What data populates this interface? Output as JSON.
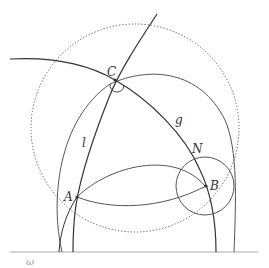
{
  "diagram": {
    "type": "geometry-construction",
    "colors": {
      "stroke_dark": "#333333",
      "stroke_mid": "#555555",
      "baseline": "#aaaaaa",
      "dotted": "#555555",
      "omega_label": "#999999"
    },
    "points": [
      {
        "name": "C",
        "label": "C",
        "x": 115,
        "y": 80,
        "label_x": 107,
        "label_y": 76
      },
      {
        "name": "A",
        "label": "A",
        "x": 77,
        "y": 197,
        "label_x": 64,
        "label_y": 201
      },
      {
        "name": "B",
        "label": "B",
        "x": 206,
        "y": 186,
        "label_x": 210,
        "label_y": 190
      },
      {
        "name": "N",
        "label": "N",
        "x": 194,
        "y": 158,
        "label_x": 192,
        "label_y": 153
      }
    ],
    "line_labels": [
      {
        "name": "l",
        "label": "l",
        "x": 82,
        "y": 147
      },
      {
        "name": "g",
        "label": "g",
        "x": 175,
        "y": 124
      }
    ],
    "baseline": {
      "label": "ω",
      "label_x": 26,
      "label_y": 265
    }
  }
}
